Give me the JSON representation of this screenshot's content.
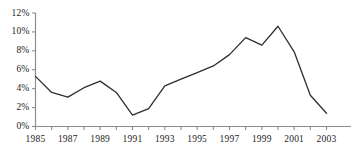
{
  "chart_data": {
    "type": "line",
    "title": "",
    "subtitle": "",
    "xlabel": "",
    "ylabel": "",
    "x": [
      1985,
      1986,
      1987,
      1988,
      1989,
      1990,
      1991,
      1992,
      1993,
      1994,
      1995,
      1996,
      1997,
      1998,
      1999,
      2000,
      2001,
      2002,
      2003
    ],
    "values": [
      5.3,
      3.6,
      3.1,
      4.1,
      4.8,
      3.6,
      1.2,
      1.9,
      4.3,
      5.0,
      5.7,
      6.4,
      7.6,
      9.4,
      8.6,
      10.6,
      7.9,
      3.3,
      1.4
    ],
    "series": [
      {
        "name": "series-1",
        "values": [
          5.3,
          3.6,
          3.1,
          4.1,
          4.8,
          3.6,
          1.2,
          1.9,
          4.3,
          5.0,
          5.7,
          6.4,
          7.6,
          9.4,
          8.6,
          10.6,
          7.9,
          3.3,
          1.4
        ]
      }
    ],
    "xlim": [
      1985,
      2003
    ],
    "ylim": [
      0,
      12
    ],
    "ytick_values": [
      0,
      2,
      4,
      6,
      8,
      10,
      12
    ],
    "ytick_labels": [
      "0%",
      "2%",
      "4%",
      "6%",
      "8%",
      "10%",
      "12%"
    ],
    "xtick_values": [
      1985,
      1986,
      1987,
      1988,
      1989,
      1990,
      1991,
      1992,
      1993,
      1994,
      1995,
      1996,
      1997,
      1998,
      1999,
      2000,
      2001,
      2002,
      2003
    ],
    "xtick_labels_shown": [
      "1985",
      "1987",
      "1989",
      "1991",
      "1993",
      "1995",
      "1997",
      "1999",
      "2001",
      "2003"
    ],
    "xtick_labeled_values": [
      1985,
      1987,
      1989,
      1991,
      1993,
      1995,
      1997,
      1999,
      2001,
      2003
    ],
    "grid": false,
    "legend": false,
    "legend_position": "none",
    "line_color": "#2e2e2e",
    "axis_color": "#8c8c8c",
    "background_color": "#ffffff"
  }
}
